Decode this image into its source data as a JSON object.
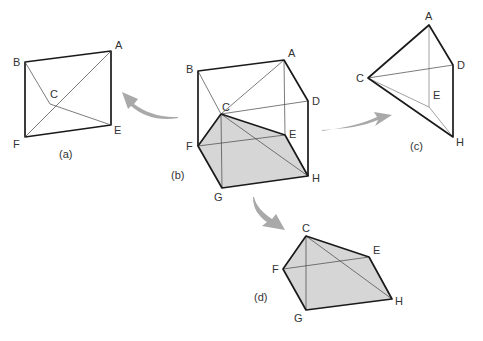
{
  "figure": {
    "colors": {
      "edge": "#1a1a1a",
      "shaded_face": "#d6d6d6",
      "arrow": "#a9a9a9",
      "label": "#333333"
    }
  },
  "panels": {
    "a": {
      "caption": "(a)",
      "vertices": [
        {
          "label": "B",
          "x": 25,
          "y": 62
        },
        {
          "label": "A",
          "x": 111,
          "y": 51
        },
        {
          "label": "C",
          "x": 50,
          "y": 104
        },
        {
          "label": "E",
          "x": 111,
          "y": 125
        },
        {
          "label": "F",
          "x": 25,
          "y": 137
        }
      ]
    },
    "b": {
      "caption": "(b)",
      "vertices": [
        {
          "label": "B",
          "x": 198,
          "y": 71
        },
        {
          "label": "A",
          "x": 284,
          "y": 60
        },
        {
          "label": "C",
          "x": 221,
          "y": 114
        },
        {
          "label": "D",
          "x": 308,
          "y": 101
        },
        {
          "label": "E",
          "x": 285,
          "y": 135
        },
        {
          "label": "F",
          "x": 198,
          "y": 146
        },
        {
          "label": "G",
          "x": 222,
          "y": 188
        },
        {
          "label": "H",
          "x": 308,
          "y": 176
        }
      ]
    },
    "c": {
      "caption": "(c)",
      "vertices": [
        {
          "label": "A",
          "x": 429,
          "y": 25
        },
        {
          "label": "C",
          "x": 368,
          "y": 78
        },
        {
          "label": "D",
          "x": 453,
          "y": 65
        },
        {
          "label": "E",
          "x": 429,
          "y": 107
        },
        {
          "label": "H",
          "x": 453,
          "y": 137
        }
      ]
    },
    "d": {
      "caption": "(d)",
      "vertices": [
        {
          "label": "C",
          "x": 306,
          "y": 236
        },
        {
          "label": "E",
          "x": 369,
          "y": 257
        },
        {
          "label": "F",
          "x": 283,
          "y": 269
        },
        {
          "label": "H",
          "x": 392,
          "y": 299
        },
        {
          "label": "G",
          "x": 306,
          "y": 310
        }
      ]
    }
  },
  "arrows": [
    {
      "from": "b",
      "to": "a",
      "direction": "left"
    },
    {
      "from": "b",
      "to": "c",
      "direction": "right"
    },
    {
      "from": "b",
      "to": "d",
      "direction": "down"
    }
  ]
}
